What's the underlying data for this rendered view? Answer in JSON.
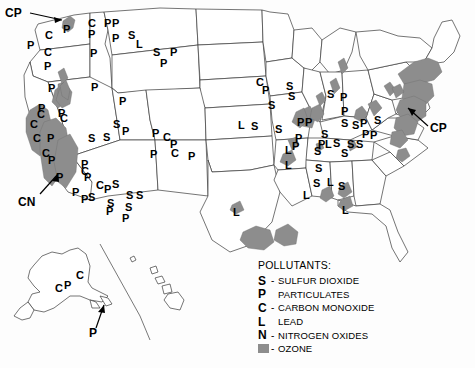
{
  "map": {
    "title": "United States Air Pollution Non-Attainment Areas",
    "ozone_color": "#8d8d8d",
    "outline_color": "#3a3a3a",
    "background_color": "#fdfdfd"
  },
  "legend": {
    "title": "POLLUTANTS:",
    "items": [
      {
        "symbol": "S",
        "dash": "-",
        "name": "SULFUR DIOXIDE"
      },
      {
        "symbol": "P",
        "dash": "",
        "name": "PARTICULATES"
      },
      {
        "symbol": "C",
        "dash": "-",
        "name": "CARBON MONOXIDE"
      },
      {
        "symbol": "L",
        "dash": "",
        "name": "LEAD"
      },
      {
        "symbol": "N",
        "dash": "-",
        "name": "NITROGEN OXIDES"
      },
      {
        "symbol": "swatch",
        "dash": "-",
        "name": "OZONE"
      }
    ]
  },
  "callouts": [
    {
      "label": "CP",
      "region": "seattle-puget-sound"
    },
    {
      "label": "CN",
      "region": "california-central-valley"
    },
    {
      "label": "CP",
      "region": "new-york-new-jersey-corridor"
    },
    {
      "label": "P",
      "region": "alaska-aleutian-islands"
    }
  ],
  "markers": [
    {
      "text": "P",
      "x": 27,
      "y": 40
    },
    {
      "text": "C",
      "x": 45,
      "y": 30
    },
    {
      "text": "P",
      "x": 63,
      "y": 24
    },
    {
      "text": "C",
      "x": 88,
      "y": 18
    },
    {
      "text": "P",
      "x": 88,
      "y": 29
    },
    {
      "text": "P",
      "x": 104,
      "y": 18
    },
    {
      "text": "P",
      "x": 112,
      "y": 18
    },
    {
      "text": "P",
      "x": 112,
      "y": 33
    },
    {
      "text": "S",
      "x": 128,
      "y": 30
    },
    {
      "text": "L",
      "x": 136,
      "y": 39
    },
    {
      "text": "C",
      "x": 44,
      "y": 47
    },
    {
      "text": "P",
      "x": 44,
      "y": 61
    },
    {
      "text": "P",
      "x": 90,
      "y": 48
    },
    {
      "text": "S",
      "x": 153,
      "y": 47
    },
    {
      "text": "P",
      "x": 170,
      "y": 47
    },
    {
      "text": "P",
      "x": 160,
      "y": 58
    },
    {
      "text": "P",
      "x": 48,
      "y": 83
    },
    {
      "text": "P",
      "x": 91,
      "y": 82
    },
    {
      "text": "P",
      "x": 119,
      "y": 96
    },
    {
      "text": "P",
      "x": 38,
      "y": 103
    },
    {
      "text": "C",
      "x": 37,
      "y": 109
    },
    {
      "text": "C",
      "x": 30,
      "y": 119
    },
    {
      "text": "P",
      "x": 58,
      "y": 108
    },
    {
      "text": "C",
      "x": 60,
      "y": 113
    },
    {
      "text": "P",
      "x": 47,
      "y": 133
    },
    {
      "text": "C",
      "x": 33,
      "y": 133
    },
    {
      "text": "S",
      "x": 113,
      "y": 119
    },
    {
      "text": "P",
      "x": 122,
      "y": 126
    },
    {
      "text": "S",
      "x": 88,
      "y": 133
    },
    {
      "text": "S",
      "x": 103,
      "y": 132
    },
    {
      "text": "P",
      "x": 152,
      "y": 128
    },
    {
      "text": "C",
      "x": 163,
      "y": 132
    },
    {
      "text": "P",
      "x": 170,
      "y": 139
    },
    {
      "text": "C",
      "x": 171,
      "y": 148
    },
    {
      "text": "P",
      "x": 150,
      "y": 149
    },
    {
      "text": "P",
      "x": 188,
      "y": 151
    },
    {
      "text": "C",
      "x": 42,
      "y": 148
    },
    {
      "text": "P",
      "x": 48,
      "y": 155
    },
    {
      "text": "P",
      "x": 56,
      "y": 172
    },
    {
      "text": "P",
      "x": 72,
      "y": 187
    },
    {
      "text": "P",
      "x": 81,
      "y": 159
    },
    {
      "text": "C",
      "x": 81,
      "y": 166
    },
    {
      "text": "P",
      "x": 84,
      "y": 172
    },
    {
      "text": "C",
      "x": 96,
      "y": 180
    },
    {
      "text": "P",
      "x": 104,
      "y": 184
    },
    {
      "text": "S",
      "x": 112,
      "y": 179
    },
    {
      "text": "P",
      "x": 81,
      "y": 194
    },
    {
      "text": "S",
      "x": 88,
      "y": 192
    },
    {
      "text": "S",
      "x": 107,
      "y": 198
    },
    {
      "text": "P",
      "x": 106,
      "y": 206
    },
    {
      "text": "S",
      "x": 126,
      "y": 190
    },
    {
      "text": "S",
      "x": 136,
      "y": 190
    },
    {
      "text": "S",
      "x": 125,
      "y": 202
    },
    {
      "text": "P",
      "x": 122,
      "y": 213
    },
    {
      "text": "C",
      "x": 256,
      "y": 77
    },
    {
      "text": "P",
      "x": 262,
      "y": 85
    },
    {
      "text": "S",
      "x": 286,
      "y": 81
    },
    {
      "text": "S",
      "x": 288,
      "y": 91
    },
    {
      "text": "S",
      "x": 268,
      "y": 100
    },
    {
      "text": "S",
      "x": 327,
      "y": 89
    },
    {
      "text": "P",
      "x": 340,
      "y": 92
    },
    {
      "text": "P",
      "x": 341,
      "y": 106
    },
    {
      "text": "S",
      "x": 275,
      "y": 124
    },
    {
      "text": "P",
      "x": 297,
      "y": 117
    },
    {
      "text": "P",
      "x": 305,
      "y": 117
    },
    {
      "text": "S",
      "x": 341,
      "y": 118
    },
    {
      "text": "S",
      "x": 352,
      "y": 120
    },
    {
      "text": "P",
      "x": 360,
      "y": 118
    },
    {
      "text": "S",
      "x": 374,
      "y": 115
    },
    {
      "text": "P",
      "x": 295,
      "y": 133
    },
    {
      "text": "S",
      "x": 321,
      "y": 129
    },
    {
      "text": "P",
      "x": 362,
      "y": 129
    },
    {
      "text": "P",
      "x": 370,
      "y": 130
    },
    {
      "text": "P",
      "x": 318,
      "y": 139
    },
    {
      "text": "L",
      "x": 325,
      "y": 139
    },
    {
      "text": "S",
      "x": 333,
      "y": 138
    },
    {
      "text": "S",
      "x": 347,
      "y": 139
    },
    {
      "text": "S",
      "x": 356,
      "y": 139
    },
    {
      "text": "L",
      "x": 285,
      "y": 145
    },
    {
      "text": "P",
      "x": 292,
      "y": 141
    },
    {
      "text": "S",
      "x": 314,
      "y": 146
    },
    {
      "text": "S",
      "x": 341,
      "y": 148
    },
    {
      "text": "L",
      "x": 285,
      "y": 160
    },
    {
      "text": "S",
      "x": 315,
      "y": 163
    },
    {
      "text": "S",
      "x": 313,
      "y": 178
    },
    {
      "text": "L",
      "x": 327,
      "y": 177
    },
    {
      "text": "S",
      "x": 338,
      "y": 181
    },
    {
      "text": "L",
      "x": 303,
      "y": 190
    },
    {
      "text": "L",
      "x": 233,
      "y": 207
    },
    {
      "text": "L",
      "x": 342,
      "y": 205
    },
    {
      "text": "S",
      "x": 251,
      "y": 121
    },
    {
      "text": "L",
      "x": 238,
      "y": 120
    },
    {
      "text": "C",
      "x": 76,
      "y": 270
    },
    {
      "text": "C",
      "x": 55,
      "y": 283
    },
    {
      "text": "P",
      "x": 64,
      "y": 280
    }
  ],
  "ozone_regions": [
    "puget-sound-wa",
    "central-valley-ca",
    "los-angeles-ca",
    "san-francisco-ca",
    "chicago-il",
    "st-louis-mo",
    "milwaukee-wi",
    "detroit-mi",
    "cleveland-oh",
    "northeast-corridor",
    "baltimore-washington",
    "houston-tx",
    "baton-rouge-la",
    "atlanta-ga",
    "birmingham-al",
    "dallas-tx"
  ]
}
